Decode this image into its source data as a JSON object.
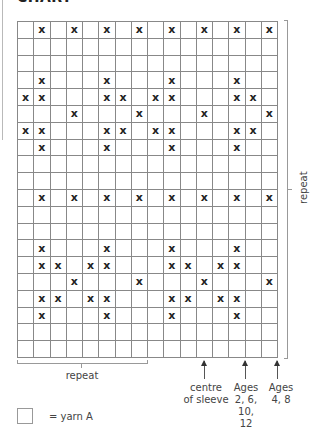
{
  "heading": "CHART",
  "chart_data": {
    "type": "table",
    "title": "CHART",
    "columns": 16,
    "rows": 20,
    "symbol": "X",
    "marked_cells_by_row": [
      [
        1,
        3,
        5,
        7,
        9,
        11,
        13,
        15
      ],
      [],
      [],
      [
        1,
        5,
        9,
        13
      ],
      [
        0,
        1,
        5,
        6,
        8,
        9,
        13,
        14
      ],
      [
        3,
        7,
        11,
        15
      ],
      [
        0,
        1,
        5,
        6,
        8,
        9,
        13,
        14
      ],
      [
        1,
        5,
        9,
        13
      ],
      [],
      [],
      [
        1,
        3,
        5,
        7,
        9,
        11,
        13,
        15
      ],
      [],
      [],
      [
        1,
        5,
        9,
        13
      ],
      [
        1,
        2,
        4,
        5,
        9,
        10,
        12,
        13
      ],
      [
        3,
        7,
        11,
        15
      ],
      [
        1,
        2,
        4,
        5,
        9,
        10,
        12,
        13
      ],
      [
        1,
        5,
        9,
        13
      ],
      [],
      []
    ],
    "horizontal_repeat": {
      "label": "repeat",
      "from_column": 0,
      "to_column": 7
    },
    "vertical_repeat": {
      "label": "repeat",
      "from_row": 0,
      "to_row": 19
    },
    "markers": [
      {
        "label": "centre of sleeve",
        "lines": [
          "centre",
          "of sleeve"
        ],
        "position": "centre of column 11"
      },
      {
        "label": "Ages 2, 6, 10, 12",
        "lines": [
          "Ages",
          "2, 6,",
          "10,",
          "12"
        ],
        "position": "line between columns 13 and 14"
      },
      {
        "label": "Ages 4, 8",
        "lines": [
          "Ages",
          "4, 8"
        ],
        "position": "right edge of grid"
      }
    ],
    "legend": [
      {
        "symbol": "blank square",
        "label": "= yarn A"
      }
    ]
  },
  "labels": {
    "repeat_bottom": "repeat",
    "repeat_right": "repeat",
    "centre_sleeve": "centre\nof sleeve",
    "ages_a": "Ages\n2, 6,\n10,\n12",
    "ages_b": "Ages\n4, 8",
    "legend_text": "= yarn A"
  }
}
